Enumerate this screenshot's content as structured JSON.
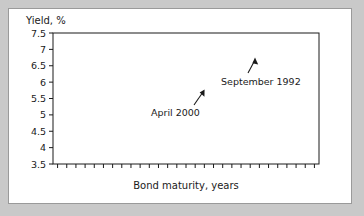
{
  "figure": {
    "background_color": "#c9c9c9",
    "card_color": "#ffffff",
    "border_color": "#9a9a9a",
    "line_color": "#1a1a1a"
  },
  "chart_data": {
    "type": "line",
    "title": "Yield, %",
    "xlabel": "Bond maturity, years",
    "ylabel": "Yield, %",
    "ylim": [
      3.5,
      7.5
    ],
    "yticks": [
      "3.5",
      "4",
      "4.5",
      "5",
      "5.5",
      "6",
      "6.5",
      "7",
      "7.5"
    ],
    "ytick_values": [
      3.5,
      4,
      4.5,
      5,
      5.5,
      6,
      6.5,
      7,
      7.5
    ],
    "xticks_labeled": [
      "2",
      "3",
      "5",
      "7",
      "10",
      "30"
    ],
    "xtick_label_values": [
      2,
      3,
      5,
      7,
      10,
      30
    ],
    "x": [
      2,
      3,
      5,
      7,
      10,
      15,
      20,
      25,
      30
    ],
    "grid": false,
    "legend_position": "inline-annotations",
    "series": [
      {
        "name": "September 1992",
        "values": [
          6.65,
          6.6,
          6.5,
          6.45,
          6.4,
          6.65,
          6.9,
          7.1,
          7.3
        ]
      },
      {
        "name": "April 2000",
        "values": [
          3.8,
          4.45,
          5.3,
          5.95,
          6.25,
          6.2,
          6.12,
          6.05,
          6.0
        ]
      }
    ],
    "annotations": [
      {
        "label": "September 1992"
      },
      {
        "label": "April 2000"
      }
    ]
  }
}
